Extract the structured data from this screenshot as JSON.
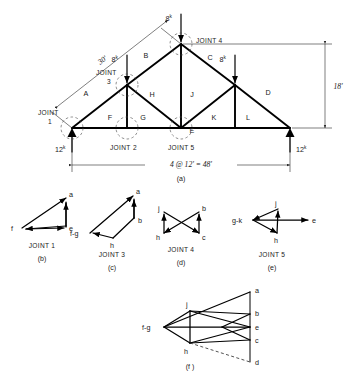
{
  "figure": {
    "caption_a": "(a)",
    "caption_b": "(b)",
    "caption_c": "(c)",
    "caption_d": "(d)",
    "caption_e": "(e)",
    "caption_f": "(f )"
  },
  "truss": {
    "loads": [
      {
        "value": "8",
        "unit": "k"
      },
      {
        "value": "8",
        "unit": "k"
      },
      {
        "value": "8",
        "unit": "k"
      }
    ],
    "reactions": [
      {
        "value": "12",
        "unit": "k"
      },
      {
        "value": "12",
        "unit": "k"
      }
    ],
    "dimensions": {
      "rafter": "30'",
      "height": "18'",
      "span": "4 @ 12' = 48'"
    },
    "space_labels": {
      "A": "A",
      "B": "B",
      "C": "C",
      "D": "D",
      "E": "E",
      "F": "F",
      "G": "G",
      "H": "H",
      "J": "J",
      "K": "K",
      "L": "L"
    },
    "joints": [
      {
        "name": "JOINT",
        "number": "1"
      },
      {
        "name": "JOINT",
        "number": "2"
      },
      {
        "name": "JOINT",
        "number": "3"
      },
      {
        "name": "JOINT 4"
      },
      {
        "name": "JOINT 5"
      }
    ]
  },
  "polygons": {
    "joint1": {
      "title": "JOINT 1",
      "vertices": [
        {
          "label": "a"
        },
        {
          "label": "e"
        },
        {
          "label": "f"
        }
      ]
    },
    "joint3": {
      "title": "JOINT 3",
      "vertices": [
        {
          "label": "a"
        },
        {
          "label": "b"
        },
        {
          "label": "h"
        },
        {
          "label": "f-g"
        }
      ]
    },
    "joint4": {
      "title": "JOINT 4",
      "vertices": [
        {
          "label": "j"
        },
        {
          "label": "b"
        },
        {
          "label": "h"
        },
        {
          "label": "c"
        }
      ]
    },
    "joint5": {
      "title": "JOINT 5",
      "vertices": [
        {
          "label": "g-k"
        },
        {
          "label": "j"
        },
        {
          "label": "h"
        },
        {
          "label": "e"
        }
      ]
    },
    "combined": {
      "vertices": [
        {
          "label": "a"
        },
        {
          "label": "b"
        },
        {
          "label": "e"
        },
        {
          "label": "c"
        },
        {
          "label": "d"
        },
        {
          "label": "j"
        },
        {
          "label": "h"
        },
        {
          "label": "f-g"
        }
      ]
    }
  }
}
